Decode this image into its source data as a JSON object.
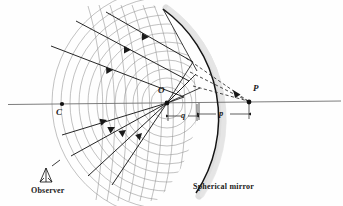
{
  "figure": {
    "kind": "optics-ray-diagram",
    "background_color": "#fefefe",
    "ink_color": "#1a1a1a",
    "wavefront_color": "#8d8d8d",
    "mirror_shadow_color": "#d9d9d9",
    "axis_color": "#6e6e6e"
  },
  "labels": {
    "center_of_curvature": "C",
    "object_point": "O",
    "image_point": "P",
    "image_distance": "q",
    "object_distance": "p",
    "mirror_caption": "Spherical mirror",
    "observer_caption": "Observer"
  },
  "points": {
    "C": {
      "x": 62,
      "y": 104
    },
    "O": {
      "x": 167,
      "y": 103
    },
    "P": {
      "x": 249,
      "y": 103
    },
    "mirror_vertex": {
      "x": 197,
      "y": 104
    }
  },
  "label_positions": {
    "C": {
      "x": 58,
      "y": 112
    },
    "O": {
      "x": 159,
      "y": 91
    },
    "P": {
      "x": 253,
      "y": 88
    },
    "q": {
      "x": 183,
      "y": 113
    },
    "p": {
      "x": 221,
      "y": 111
    },
    "mirror_caption": {
      "x": 193,
      "y": 183
    },
    "observer_caption": {
      "x": 31,
      "y": 186
    }
  },
  "geometry": {
    "axis": {
      "x1": 8,
      "y1": 104,
      "x2": 340,
      "y2": 101
    },
    "mirror_arc_center": {
      "x": 62,
      "y": 104
    },
    "mirror_arc_radius": 135,
    "incident_rays": [
      {
        "x1": 106,
        "y1": 12,
        "x2": 190,
        "y2": 60,
        "arrow_t": 0.45
      },
      {
        "x1": 76,
        "y1": 21,
        "x2": 186,
        "y2": 79,
        "arrow_t": 0.45
      },
      {
        "x1": 51,
        "y1": 46,
        "x2": 181,
        "y2": 95,
        "arrow_t": 0.48
      }
    ],
    "reflected_rays": [
      {
        "x1": 167,
        "y1": 103,
        "x2": 103,
        "y2": 178,
        "arrow_t": 0.55
      },
      {
        "x1": 167,
        "y1": 103,
        "x2": 80,
        "y2": 171,
        "arrow_t": 0.55
      },
      {
        "x1": 167,
        "y1": 103,
        "x2": 71,
        "y2": 150,
        "arrow_t": 0.58
      }
    ],
    "virtual_rays_dashed": 3,
    "wavefronts_incident_count": 11,
    "wavefronts_reflected_count": 12
  },
  "dimensions": {
    "q_span": {
      "x_start": 169,
      "x_end": 197,
      "y": 116
    },
    "p_span": {
      "x_start": 199,
      "x_end": 249,
      "y": 114
    }
  }
}
